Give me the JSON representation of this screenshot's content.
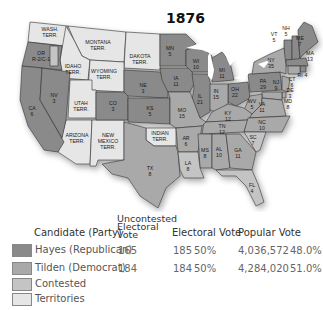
{
  "title": "1876",
  "colors": {
    "hayes": "#8a8a8a",
    "tilden": "#a9a9a9",
    "contested": "#c4c4c4",
    "territories": "#e6e6e6",
    "water": "#ffffff"
  },
  "map": {
    "territories": [
      {
        "name": "WASH. TERR."
      },
      {
        "name": "MONTANA TERR."
      },
      {
        "name": "DAKOTA TERR."
      },
      {
        "name": "IDAHO TERR."
      },
      {
        "name": "WYOMING TERR."
      },
      {
        "name": "UTAH TERR."
      },
      {
        "name": "ARIZONA TERR."
      },
      {
        "name": "NEW MEXICO TERR."
      },
      {
        "name": "INDIAN TERR."
      }
    ],
    "states": [
      {
        "abbr": "OR",
        "votes": "R-2/C-1",
        "result": "contested"
      },
      {
        "abbr": "CA",
        "votes": "6",
        "result": "hayes"
      },
      {
        "abbr": "NV",
        "votes": "3",
        "result": "hayes"
      },
      {
        "abbr": "CO",
        "votes": "3",
        "result": "hayes"
      },
      {
        "abbr": "NE",
        "votes": "3",
        "result": "hayes"
      },
      {
        "abbr": "KS",
        "votes": "5",
        "result": "hayes"
      },
      {
        "abbr": "TX",
        "votes": "8",
        "result": "tilden"
      },
      {
        "abbr": "MN",
        "votes": "5",
        "result": "hayes"
      },
      {
        "abbr": "IA",
        "votes": "11",
        "result": "hayes"
      },
      {
        "abbr": "MO",
        "votes": "15",
        "result": "tilden"
      },
      {
        "abbr": "AR",
        "votes": "6",
        "result": "tilden"
      },
      {
        "abbr": "LA",
        "votes": "8",
        "result": "contested"
      },
      {
        "abbr": "WI",
        "votes": "10",
        "result": "hayes"
      },
      {
        "abbr": "IL",
        "votes": "21",
        "result": "hayes"
      },
      {
        "abbr": "MI",
        "votes": "11",
        "result": "hayes"
      },
      {
        "abbr": "IN",
        "votes": "15",
        "result": "tilden"
      },
      {
        "abbr": "OH",
        "votes": "22",
        "result": "hayes"
      },
      {
        "abbr": "KY",
        "votes": "12",
        "result": "tilden"
      },
      {
        "abbr": "TN",
        "votes": "12",
        "result": "tilden"
      },
      {
        "abbr": "MS",
        "votes": "8",
        "result": "tilden"
      },
      {
        "abbr": "AL",
        "votes": "10",
        "result": "tilden"
      },
      {
        "abbr": "GA",
        "votes": "11",
        "result": "tilden"
      },
      {
        "abbr": "FL",
        "votes": "4",
        "result": "contested"
      },
      {
        "abbr": "SC",
        "votes": "7",
        "result": "contested"
      },
      {
        "abbr": "NC",
        "votes": "10",
        "result": "tilden"
      },
      {
        "abbr": "VA",
        "votes": "11",
        "result": "tilden"
      },
      {
        "abbr": "WV",
        "votes": "5",
        "result": "tilden"
      },
      {
        "abbr": "PA",
        "votes": "29",
        "result": "hayes"
      },
      {
        "abbr": "NY",
        "votes": "35",
        "result": "tilden"
      },
      {
        "abbr": "NJ",
        "votes": "9",
        "result": "tilden"
      },
      {
        "abbr": "DE",
        "votes": "3",
        "result": "tilden"
      },
      {
        "abbr": "MD",
        "votes": "8",
        "result": "tilden"
      },
      {
        "abbr": "CT",
        "votes": "6",
        "result": "tilden"
      },
      {
        "abbr": "RI",
        "votes": "4",
        "result": "hayes"
      },
      {
        "abbr": "MA",
        "votes": "13",
        "result": "hayes"
      },
      {
        "abbr": "VT",
        "votes": "5",
        "result": "hayes"
      },
      {
        "abbr": "NH",
        "votes": "5",
        "result": "hayes"
      },
      {
        "abbr": "ME",
        "votes": "7",
        "result": "hayes"
      }
    ]
  },
  "legend": {
    "headers": {
      "candidate": "Candidate (Party)",
      "uncontested_1": "Uncontested",
      "uncontested_2": "Electoral",
      "uncontested_3": "Vote",
      "electoral": "Electoral Vote",
      "popular": "Popular Vote"
    },
    "rows": [
      {
        "label": "Hayes (Republican)",
        "uncontested": "165",
        "electoral": "185",
        "electoral_pct": "50%",
        "popular": "4,036,572",
        "popular_pct": "48.0%"
      },
      {
        "label": "Tilden (Democrat)",
        "uncontested": "184",
        "electoral": "184",
        "electoral_pct": "50%",
        "popular": "4,284,020",
        "popular_pct": "51.0%"
      },
      {
        "label": "Contested"
      },
      {
        "label": "Territories"
      }
    ]
  }
}
